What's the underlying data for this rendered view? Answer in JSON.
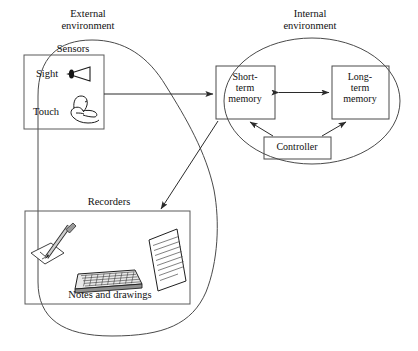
{
  "diagram": {
    "title_not_shown": "",
    "external": {
      "label": "External\nenvironment",
      "sensors": {
        "label": "Sensors",
        "items": [
          {
            "label": "Sight",
            "icon": "eye-icon"
          },
          {
            "label": "Touch",
            "icon": "hand-icon"
          }
        ]
      },
      "recorders": {
        "label": "Recorders",
        "caption": "Notes and drawings",
        "icons": [
          "pencil-sketch-icon",
          "keyboard-icon",
          "lined-document-icon"
        ]
      }
    },
    "internal": {
      "label": "Internal\nenvironment",
      "nodes": [
        {
          "id": "stm",
          "label": "Short-\nterm\nmemory"
        },
        {
          "id": "ltm",
          "label": "Long-\nterm\nmemory"
        },
        {
          "id": "controller",
          "label": "Controller"
        }
      ]
    },
    "connections": [
      {
        "from": "sensors",
        "to": "stm",
        "style": "single-arrow"
      },
      {
        "from": "stm",
        "to": "ltm",
        "style": "double-arrow"
      },
      {
        "from": "controller",
        "to": "stm",
        "style": "single-arrow"
      },
      {
        "from": "controller",
        "to": "ltm",
        "style": "single-arrow"
      },
      {
        "from": "stm",
        "to": "recorders",
        "style": "single-arrow"
      }
    ],
    "colors": {
      "stroke": "#3a3a3a",
      "ink": "#101010",
      "background": "#ffffff",
      "icon_fill": "#b9b9b9"
    }
  }
}
